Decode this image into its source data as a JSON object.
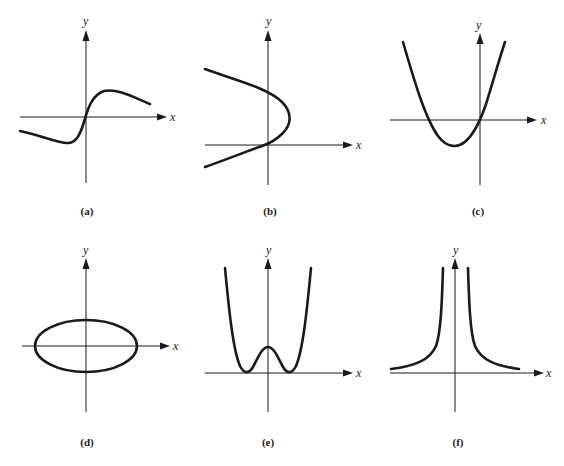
{
  "figure": {
    "panels": [
      {
        "id": "a",
        "label": "(a)",
        "x_axis_label": "x",
        "y_axis_label": "y",
        "curve": "odd S-shaped curve through origin: local min left of origin, local max right, decaying toward axis"
      },
      {
        "id": "b",
        "label": "(b)",
        "x_axis_label": "x",
        "y_axis_label": "y",
        "curve": "sideways parabola opening left, vertex to the right of y-axis, passing through origin"
      },
      {
        "id": "c",
        "label": "(c)",
        "x_axis_label": "x",
        "y_axis_label": "y",
        "curve": "upward parabola through origin with minimum left of y-axis"
      },
      {
        "id": "d",
        "label": "(d)",
        "x_axis_label": "x",
        "y_axis_label": "y",
        "curve": "ellipse centered at origin, wider than tall"
      },
      {
        "id": "e",
        "label": "(e)",
        "x_axis_label": "x",
        "y_axis_label": "y",
        "curve": "quartic W-shape: two minima touching x-axis, local max on y-axis"
      },
      {
        "id": "f",
        "label": "(f)",
        "x_axis_label": "x",
        "y_axis_label": "y",
        "curve": "even function with vertical asymptote at y-axis, decaying to x-axis"
      }
    ]
  }
}
